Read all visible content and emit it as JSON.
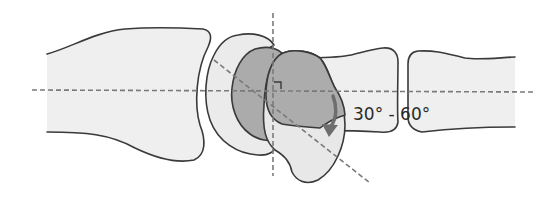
{
  "diagram": {
    "type": "anatomical-joint-diagram",
    "angle_label": "30° - 60°",
    "elements": [
      {
        "name": "proximal-bone",
        "description": "Large bone shaft on the left"
      },
      {
        "name": "outer-carpal-bone",
        "description": "Crescent-shaped light bone"
      },
      {
        "name": "inner-carpal-bone",
        "description": "Crescent-shaped dark bone"
      },
      {
        "name": "rotated-bone",
        "description": "Tilted light bone with dark overlap"
      },
      {
        "name": "middle-bone",
        "description": "Bone segment right of joint"
      },
      {
        "name": "distal-bone",
        "description": "Bone segment on the far right"
      },
      {
        "name": "horizontal-axis",
        "description": "Dashed longitudinal axis"
      },
      {
        "name": "vertical-axis",
        "description": "Dashed perpendicular axis"
      },
      {
        "name": "oblique-axis",
        "description": "Dashed rotated axis"
      },
      {
        "name": "right-angle-marker",
        "description": "Square marker at axis intersection"
      },
      {
        "name": "rotation-arrow",
        "description": "Curved arrow indicating rotation"
      }
    ],
    "colors": {
      "light_fill": "#ededed",
      "dark_fill": "#a8a8a8",
      "outline": "#3a3a3a",
      "axis": "#7a7a7a",
      "arrow": "#6e6e6e"
    }
  }
}
